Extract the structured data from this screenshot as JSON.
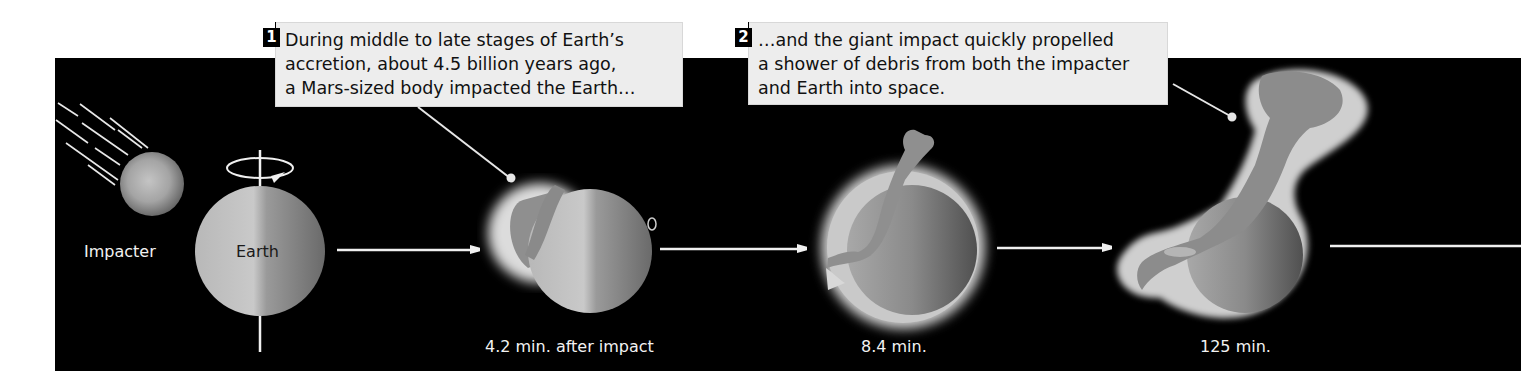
{
  "figure": {
    "background_color": "#000000",
    "caption_box_color": "#ededed",
    "steps": [
      {
        "number": "1",
        "lines": [
          "During middle to late stages of  Earth’s",
          "accretion, about 4.5 billion years ago,",
          "a Mars-sized body impacted the Earth…"
        ]
      },
      {
        "number": "2",
        "lines": [
          "…and the giant impact quickly propelled",
          "a shower of debris from both the impacter",
          "and Earth into space."
        ]
      }
    ],
    "bodies": {
      "impacter": "Impacter",
      "earth": "Earth"
    },
    "stage_labels": [
      "4.2 min. after impact",
      "8.4 min.",
      "125 min."
    ],
    "icons": [
      "rotation-arrow-icon",
      "motion-lines-icon",
      "right-arrow-icon"
    ]
  }
}
